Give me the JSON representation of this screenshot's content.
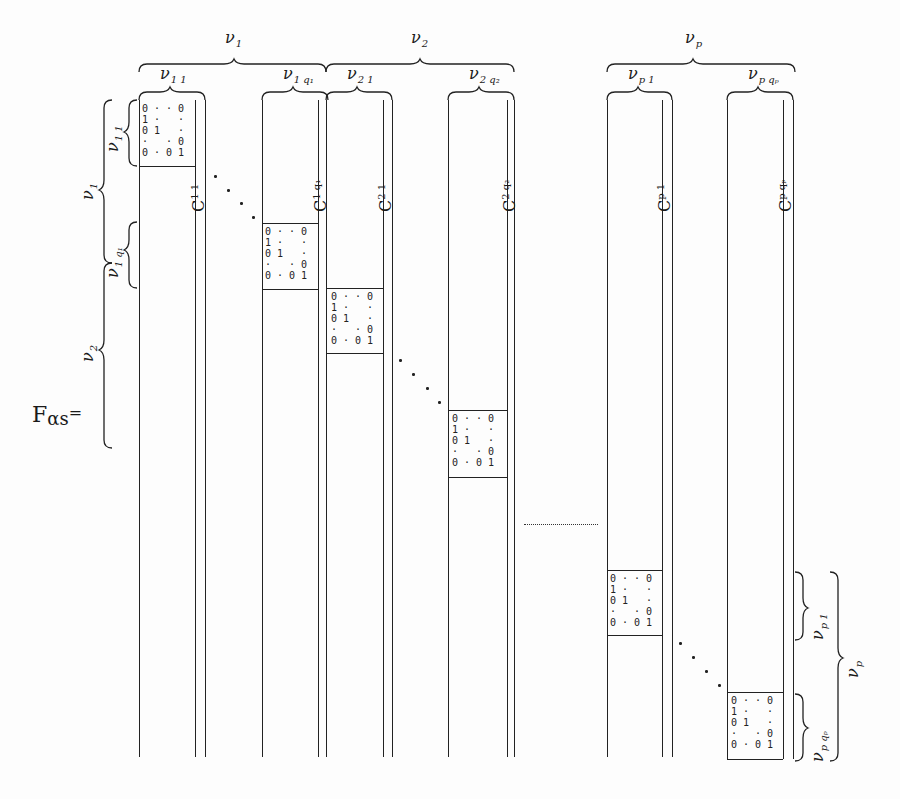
{
  "formula": {
    "lhs": "F",
    "lhs_sub": "αs",
    "equals": "="
  },
  "top_braces": [
    {
      "label": "ν",
      "sub": "1"
    },
    {
      "label": "ν",
      "sub": "2"
    },
    {
      "label": "ν",
      "sub": "p"
    }
  ],
  "column_braces": [
    {
      "label": "ν",
      "sub": "1 1"
    },
    {
      "label": "ν",
      "sub": "1 q₁"
    },
    {
      "label": "ν",
      "sub": "2 1"
    },
    {
      "label": "ν",
      "sub": "2 q₂"
    },
    {
      "label": "ν",
      "sub": "p 1"
    },
    {
      "label": "ν",
      "sub": "p qₚ"
    }
  ],
  "column_labels": [
    {
      "label": "C",
      "sup": "1 1"
    },
    {
      "label": "C",
      "sup": "1 q₁"
    },
    {
      "label": "C",
      "sup": "2 1"
    },
    {
      "label": "C",
      "sup": "2 q₂"
    },
    {
      "label": "C",
      "sup": "p 1"
    },
    {
      "label": "C",
      "sup": "p qₚ"
    }
  ],
  "left_braces": [
    {
      "label": "ν",
      "sub": "1"
    },
    {
      "label": "ν",
      "sub": "1 1"
    },
    {
      "label": "ν",
      "sub": "1 q₁"
    },
    {
      "label": "ν",
      "sub": "2"
    }
  ],
  "right_braces": [
    {
      "label": "ν",
      "sub": "p 1"
    },
    {
      "label": "ν",
      "sub": "p qₚ"
    },
    {
      "label": "ν",
      "sub": "p"
    }
  ],
  "identity_block": {
    "rows": [
      "0 · · 0",
      "1 ·   ·",
      "0 1   ·",
      "·   · 0",
      "0 · 0 1"
    ]
  },
  "colors": {
    "ink": "#222222",
    "paper": "#fdfdfd"
  }
}
